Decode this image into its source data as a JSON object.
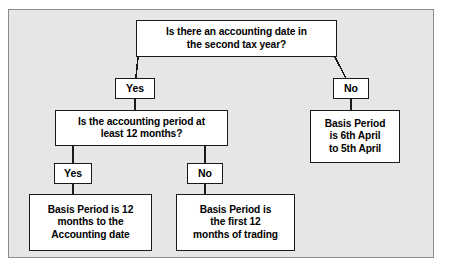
{
  "diagram": {
    "colors": {
      "canvas_background": "#e6e6e6",
      "node_fill": "#ffffff",
      "node_border": "#1a1a1a",
      "text": "#000000",
      "connector": "#1a1a1a"
    },
    "nodes": {
      "q1": {
        "type": "decision",
        "line1": "Is there an accounting date in",
        "line2": "the second tax year?"
      },
      "yes1": {
        "type": "label",
        "text": "Yes"
      },
      "no1": {
        "type": "label",
        "text": "No"
      },
      "q2": {
        "type": "decision",
        "line1": "Is the accounting period at",
        "line2": "least 12 months?"
      },
      "yes2": {
        "type": "label",
        "text": "Yes"
      },
      "no2": {
        "type": "label",
        "text": "No"
      },
      "result_twelve_months": {
        "type": "result",
        "line1": "Basis Period is 12",
        "line2": "months to the",
        "line3": "Accounting date"
      },
      "result_first_twelve": {
        "type": "result",
        "line1": "Basis Period is",
        "line2": "the first 12",
        "line3": "months of trading"
      },
      "result_april": {
        "type": "result",
        "line1": "Basis Period",
        "line2": "is 6th April",
        "line3": "to 5th April"
      }
    }
  }
}
